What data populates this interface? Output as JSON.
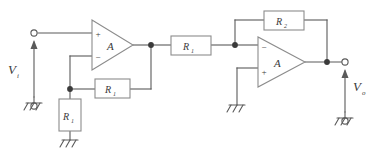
{
  "diagram": {
    "background_color": "#ffffff",
    "wire_color": "#5a5a5a",
    "component_border_color": "#8c8c8c",
    "component_fill_color": "#ffffff",
    "label_color": "#3b3b3b"
  },
  "labels": {
    "input_source": "V",
    "input_source_sub": "i",
    "output_node": "V",
    "output_node_sub": "o",
    "opamp1": "A",
    "opamp2": "A",
    "opamp1_plus": "+",
    "opamp1_minus": "−",
    "opamp2_minus": "−",
    "opamp2_plus": "+"
  },
  "components": {
    "resistors": [
      {
        "id": "r-feedback-1",
        "label": "R",
        "sub": "1",
        "orientation": "horizontal",
        "role": "stage1-feedback"
      },
      {
        "id": "r-shunt-1",
        "label": "R",
        "sub": "1",
        "orientation": "vertical",
        "role": "stage1-ground-leg"
      },
      {
        "id": "r-series-1",
        "label": "R",
        "sub": "1",
        "orientation": "horizontal",
        "role": "interstage-series"
      },
      {
        "id": "r-feedback-2",
        "label": "R",
        "sub": "2",
        "orientation": "horizontal",
        "role": "stage2-feedback"
      }
    ],
    "opamps": [
      {
        "id": "opamp-1",
        "label": "A",
        "top_input": "+",
        "bottom_input": "−"
      },
      {
        "id": "opamp-2",
        "label": "A",
        "top_input": "−",
        "bottom_input": "+"
      }
    ],
    "grounds": [
      {
        "id": "ground-input-source"
      },
      {
        "id": "ground-shunt-resistor"
      },
      {
        "id": "ground-opamp2-plus"
      },
      {
        "id": "ground-output-reference"
      }
    ],
    "terminals": [
      {
        "id": "terminal-input-top"
      },
      {
        "id": "terminal-input-bottom"
      },
      {
        "id": "terminal-output-top"
      },
      {
        "id": "terminal-output-bottom"
      }
    ],
    "junction_dots": [
      {
        "id": "junction-opamp1-output"
      },
      {
        "id": "junction-inverting-node-1"
      },
      {
        "id": "junction-stage2-summing-node"
      },
      {
        "id": "junction-opamp2-output"
      }
    ]
  }
}
